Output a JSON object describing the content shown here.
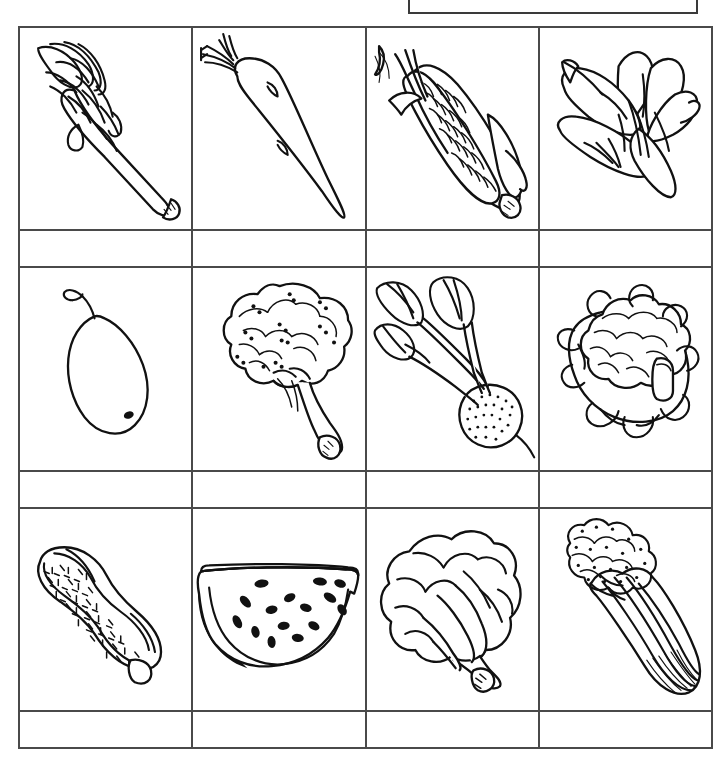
{
  "worksheet": {
    "title": "Vegetable picture identification worksheet",
    "top_box": {
      "name": "answer-box",
      "content": ""
    },
    "grid": {
      "columns": 4,
      "picture_rows": 3,
      "answer_rows": 3,
      "line_color": "#4a4a4a",
      "background": "#ffffff"
    },
    "rows": [
      {
        "type": "pictures",
        "cells": [
          {
            "icon": "asparagus-icon",
            "label": "asparagus"
          },
          {
            "icon": "carrot-icon",
            "label": "carrot"
          },
          {
            "icon": "corn-icon",
            "label": "corn"
          },
          {
            "icon": "spinach-leaves-icon",
            "label": "spinach"
          }
        ]
      },
      {
        "type": "answers",
        "cells": [
          {
            "value": ""
          },
          {
            "value": ""
          },
          {
            "value": ""
          },
          {
            "value": ""
          }
        ]
      },
      {
        "type": "pictures",
        "cells": [
          {
            "icon": "pear-icon",
            "label": "pear"
          },
          {
            "icon": "broccoli-icon",
            "label": "broccoli"
          },
          {
            "icon": "radish-icon",
            "label": "radish"
          },
          {
            "icon": "cauliflower-icon",
            "label": "cauliflower"
          }
        ]
      },
      {
        "type": "answers",
        "cells": [
          {
            "value": ""
          },
          {
            "value": ""
          },
          {
            "value": ""
          },
          {
            "value": ""
          }
        ]
      },
      {
        "type": "pictures",
        "cells": [
          {
            "icon": "peanut-icon",
            "label": "peanut"
          },
          {
            "icon": "watermelon-slice-icon",
            "label": "watermelon"
          },
          {
            "icon": "lettuce-icon",
            "label": "lettuce"
          },
          {
            "icon": "celery-icon",
            "label": "celery"
          }
        ]
      },
      {
        "type": "answers",
        "cells": [
          {
            "value": ""
          },
          {
            "value": ""
          },
          {
            "value": ""
          },
          {
            "value": ""
          }
        ]
      }
    ]
  }
}
